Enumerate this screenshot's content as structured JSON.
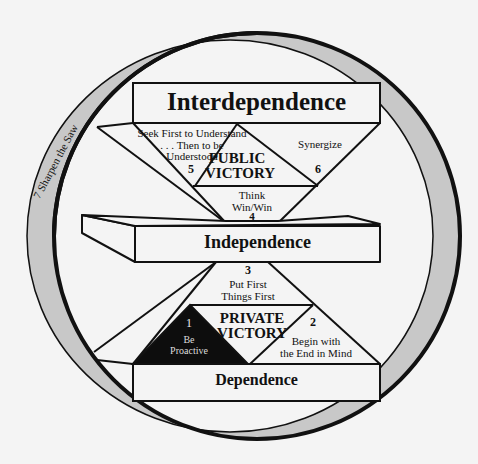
{
  "diagram": {
    "levels": {
      "interdependence": "Interdependence",
      "independence": "Independence",
      "dependence": "Dependence"
    },
    "victories": {
      "public_line1": "PUBLIC",
      "public_line2": "VICTORY",
      "private_line1": "PRIVATE",
      "private_line2": "VICTORY"
    },
    "habits": [
      {
        "number": "1",
        "line1": "Be",
        "line2": "Proactive"
      },
      {
        "number": "2",
        "line1": "Begin with",
        "line2": "the End in Mind"
      },
      {
        "number": "3",
        "line1": "Put First",
        "line2": "Things First"
      },
      {
        "number": "4",
        "line1": "Think",
        "line2": "Win/Win"
      },
      {
        "number": "5",
        "line1": "Seek First to Understand",
        "line2": ". . . Then to be",
        "line3": "Understood"
      },
      {
        "number": "6",
        "line1": "Synergize"
      },
      {
        "number": "7",
        "line1": "Sharpen the Saw",
        "label": "7  Sharpen the Saw"
      }
    ],
    "colors": {
      "line": "#111111",
      "ring_fill": "#c8c8c8",
      "box_fill": "#f4f4f4",
      "habit1_fill": "#0d0d0d",
      "background": "#f4f4f4"
    }
  }
}
